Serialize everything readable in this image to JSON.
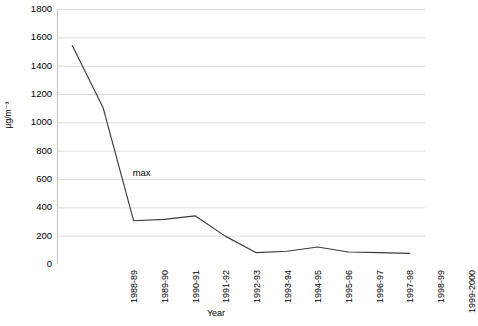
{
  "chart_data": {
    "type": "line",
    "title": "",
    "subtitle": "",
    "xlabel": "Year",
    "ylabel": "µg/m⁻³",
    "categories": [
      "1988-89",
      "1989-90",
      "1990-91",
      "1991-92",
      "1992-93",
      "1993-94",
      "1994-95",
      "1995-96",
      "1996-97",
      "1997-98",
      "1998-99",
      "1999-2000"
    ],
    "series": [
      {
        "name": "max",
        "values": [
          1540,
          1105,
          305,
          315,
          340,
          195,
          80,
          90,
          120,
          85,
          80,
          75
        ],
        "color": "#3b3b3b"
      }
    ],
    "ylim": [
      0,
      1800
    ],
    "ytick_values": [
      0,
      200,
      400,
      600,
      800,
      1000,
      1200,
      1400,
      1600,
      1800
    ],
    "ytick_labels": [
      "0",
      "200",
      "400",
      "600",
      "800",
      "1000",
      "1200",
      "1400",
      "1600",
      "1800"
    ],
    "grid": true,
    "grid_color": "#d9d9d9",
    "legend": "none",
    "annotations": [
      {
        "text": "max",
        "category": "1990-91",
        "value": 640
      }
    ]
  },
  "axes": {
    "x_title": "Year",
    "y_title": "µg/m⁻³"
  },
  "colors": {
    "line": "#3b3b3b",
    "grid": "#d9d9d9",
    "axis": "#bfbfbf",
    "background": "#ffffff",
    "text": "#000000"
  }
}
